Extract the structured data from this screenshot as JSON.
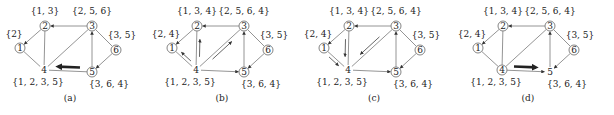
{
  "figure": {
    "panels": [
      {
        "caption": "(a)",
        "offset_x": 0,
        "nodes": [
          {
            "id": "1",
            "label": "{2}",
            "circled": true
          },
          {
            "id": "2",
            "label": "{1, 3}",
            "circled": true
          },
          {
            "id": "3",
            "label": "{2, 5, 6}",
            "circled": true
          },
          {
            "id": "4",
            "label": "{1, 2, 3, 5}",
            "circled": false
          },
          {
            "id": "5",
            "label": "{3, 6, 4}",
            "circled": true
          },
          {
            "id": "6",
            "label": "{3, 5}",
            "circled": true
          }
        ],
        "directed_edges": [
          [
            "3",
            "2"
          ],
          [
            "2",
            "1"
          ],
          [
            "5",
            "3"
          ],
          [
            "6",
            "5"
          ]
        ],
        "undirected_edges": [
          [
            "1",
            "4"
          ],
          [
            "2",
            "4"
          ],
          [
            "3",
            "4"
          ],
          [
            "4",
            "5"
          ],
          [
            "3",
            "6"
          ]
        ],
        "highlight": {
          "from": "5",
          "to": "4",
          "style": "thick-arrow"
        }
      },
      {
        "caption": "(b)",
        "offset_x": 152,
        "nodes": [
          {
            "id": "1",
            "label": "{2, 4}",
            "circled": true
          },
          {
            "id": "2",
            "label": "{1, 3, 4}",
            "circled": true
          },
          {
            "id": "3",
            "label": "{2, 5, 6, 4}",
            "circled": true
          },
          {
            "id": "4",
            "label": "{1, 2, 3, 5}",
            "circled": false
          },
          {
            "id": "5",
            "label": "{3, 6, 4}",
            "circled": true
          },
          {
            "id": "6",
            "label": "{3, 5}",
            "circled": true
          }
        ],
        "directed_edges": [
          [
            "3",
            "2"
          ],
          [
            "2",
            "1"
          ],
          [
            "5",
            "3"
          ],
          [
            "6",
            "5"
          ],
          [
            "4",
            "5"
          ]
        ],
        "undirected_edges": [
          [
            "1",
            "4"
          ],
          [
            "2",
            "4"
          ],
          [
            "3",
            "4"
          ],
          [
            "3",
            "6"
          ]
        ],
        "highlight": {
          "messages": [
            [
              "4",
              "1"
            ],
            [
              "4",
              "2"
            ],
            [
              "4",
              "3"
            ]
          ],
          "style": "thin-parallel-arrows"
        }
      },
      {
        "caption": "(c)",
        "offset_x": 304,
        "nodes": [
          {
            "id": "1",
            "label": "{2, 4}",
            "circled": true
          },
          {
            "id": "2",
            "label": "{1, 3, 4}",
            "circled": true
          },
          {
            "id": "3",
            "label": "{2, 5, 6, 4}",
            "circled": true
          },
          {
            "id": "4",
            "label": "{1, 2, 3, 5}",
            "circled": false
          },
          {
            "id": "5",
            "label": "{3, 6, 4}",
            "circled": true
          },
          {
            "id": "6",
            "label": "{3, 5}",
            "circled": true
          }
        ],
        "directed_edges": [
          [
            "3",
            "2"
          ],
          [
            "2",
            "1"
          ],
          [
            "5",
            "3"
          ],
          [
            "6",
            "5"
          ],
          [
            "4",
            "5"
          ]
        ],
        "undirected_edges": [
          [
            "1",
            "4"
          ],
          [
            "2",
            "4"
          ],
          [
            "3",
            "4"
          ],
          [
            "3",
            "6"
          ]
        ],
        "highlight": {
          "messages": [
            [
              "1",
              "4"
            ],
            [
              "2",
              "4"
            ],
            [
              "3",
              "4"
            ]
          ],
          "style": "thin-parallel-arrows"
        }
      },
      {
        "caption": "(d)",
        "offset_x": 458,
        "nodes": [
          {
            "id": "1",
            "label": "{2, 4}",
            "circled": true
          },
          {
            "id": "2",
            "label": "{1, 3, 4}",
            "circled": true
          },
          {
            "id": "3",
            "label": "{2, 5, 6, 4}",
            "circled": true
          },
          {
            "id": "4",
            "label": "{1, 2, 3, 5}",
            "circled": true
          },
          {
            "id": "5",
            "label": "{3, 6, 4}",
            "circled": false
          },
          {
            "id": "6",
            "label": "{3, 5}",
            "circled": true
          }
        ],
        "directed_edges": [
          [
            "3",
            "2"
          ],
          [
            "2",
            "1"
          ],
          [
            "5",
            "3"
          ],
          [
            "6",
            "5"
          ],
          [
            "4",
            "5"
          ]
        ],
        "undirected_edges": [
          [
            "1",
            "4"
          ],
          [
            "2",
            "4"
          ],
          [
            "3",
            "4"
          ],
          [
            "3",
            "6"
          ]
        ],
        "highlight": {
          "from": "4",
          "to": "5",
          "style": "thick-arrow"
        }
      }
    ]
  }
}
